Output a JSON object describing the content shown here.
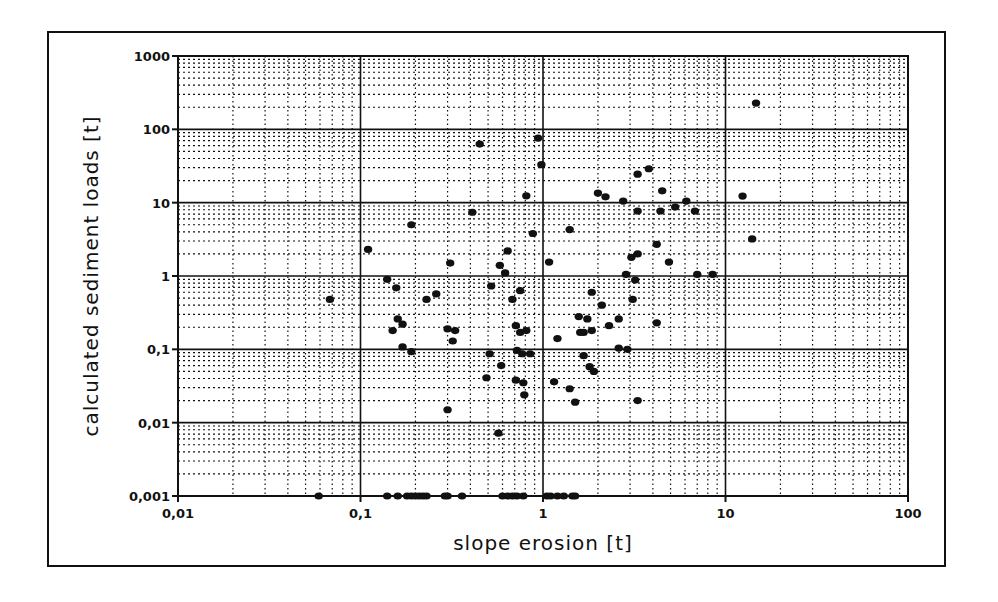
{
  "chart_data": {
    "type": "scatter",
    "title": "",
    "xlabel": "slope erosion [t]",
    "ylabel": "calculated sediment loads [t]",
    "xscale": "log",
    "yscale": "log",
    "xlim": [
      0.01,
      100
    ],
    "ylim": [
      0.001,
      1000
    ],
    "grid": "major solid, minor dotted (log 2-9)",
    "legend": null,
    "xticks": [
      0.01,
      0.1,
      1,
      10,
      100
    ],
    "xtick_labels": [
      "0,01",
      "0,1",
      "1",
      "10",
      "100"
    ],
    "yticks": [
      0.001,
      0.01,
      0.1,
      1,
      10,
      100,
      1000
    ],
    "ytick_labels": [
      "0,001",
      "0,01",
      "0,1",
      "1",
      "10",
      "100",
      "1000"
    ],
    "series": [
      {
        "name": "observations",
        "marker": "filled-circle",
        "color": "#111111",
        "points": [
          [
            0.45,
            63
          ],
          [
            0.94,
            76
          ],
          [
            0.98,
            33
          ],
          [
            0.81,
            12.4
          ],
          [
            0.41,
            7.4
          ],
          [
            0.19,
            5.0
          ],
          [
            0.88,
            3.8
          ],
          [
            0.11,
            2.3
          ],
          [
            0.64,
            2.2
          ],
          [
            0.31,
            1.5
          ],
          [
            0.58,
            1.4
          ],
          [
            1.08,
            1.55
          ],
          [
            0.62,
            1.1
          ],
          [
            0.14,
            0.9
          ],
          [
            0.068,
            0.48
          ],
          [
            0.157,
            0.69
          ],
          [
            0.23,
            0.48
          ],
          [
            0.26,
            0.57
          ],
          [
            0.16,
            0.26
          ],
          [
            0.17,
            0.22
          ],
          [
            0.15,
            0.18
          ],
          [
            0.3,
            0.19
          ],
          [
            0.33,
            0.18
          ],
          [
            0.32,
            0.13
          ],
          [
            0.17,
            0.108
          ],
          [
            0.19,
            0.093
          ],
          [
            0.52,
            0.73
          ],
          [
            0.75,
            0.63
          ],
          [
            0.68,
            0.48
          ],
          [
            0.71,
            0.21
          ],
          [
            0.75,
            0.17
          ],
          [
            0.81,
            0.18
          ],
          [
            1.2,
            0.14
          ],
          [
            0.51,
            0.087
          ],
          [
            0.72,
            0.097
          ],
          [
            0.77,
            0.087
          ],
          [
            0.85,
            0.087
          ],
          [
            0.59,
            0.06
          ],
          [
            0.49,
            0.041
          ],
          [
            0.71,
            0.038
          ],
          [
            0.78,
            0.035
          ],
          [
            1.15,
            0.036
          ],
          [
            0.79,
            0.024
          ],
          [
            0.3,
            0.015
          ],
          [
            0.57,
            0.0072
          ],
          [
            1.4,
            0.029
          ],
          [
            1.5,
            0.019
          ],
          [
            3.3,
            24.5
          ],
          [
            3.8,
            29
          ],
          [
            4.5,
            14.5
          ],
          [
            2.0,
            13.5
          ],
          [
            2.2,
            12
          ],
          [
            2.75,
            10.5
          ],
          [
            3.3,
            7.7
          ],
          [
            4.4,
            7.7
          ],
          [
            5.3,
            8.7
          ],
          [
            6.1,
            10.5
          ],
          [
            6.8,
            7.7
          ],
          [
            12.4,
            12.3
          ],
          [
            1.4,
            4.3
          ],
          [
            4.2,
            2.7
          ],
          [
            14,
            3.2
          ],
          [
            3.05,
            1.8
          ],
          [
            3.3,
            2.0
          ],
          [
            4.9,
            1.55
          ],
          [
            2.85,
            1.05
          ],
          [
            3.2,
            0.88
          ],
          [
            7.0,
            1.05
          ],
          [
            8.5,
            1.05
          ],
          [
            1.85,
            0.6
          ],
          [
            3.1,
            0.48
          ],
          [
            2.1,
            0.4
          ],
          [
            1.57,
            0.28
          ],
          [
            1.75,
            0.26
          ],
          [
            2.6,
            0.26
          ],
          [
            2.3,
            0.21
          ],
          [
            4.2,
            0.23
          ],
          [
            1.6,
            0.17
          ],
          [
            1.67,
            0.17
          ],
          [
            1.85,
            0.18
          ],
          [
            2.6,
            0.104
          ],
          [
            2.9,
            0.1
          ],
          [
            1.67,
            0.082
          ],
          [
            1.8,
            0.058
          ],
          [
            1.9,
            0.05
          ],
          [
            3.3,
            0.02
          ],
          [
            14.7,
            228
          ],
          [
            0.059,
            0.001
          ],
          [
            0.14,
            0.001
          ],
          [
            0.16,
            0.001
          ],
          [
            0.18,
            0.001
          ],
          [
            0.19,
            0.001
          ],
          [
            0.2,
            0.001
          ],
          [
            0.21,
            0.001
          ],
          [
            0.22,
            0.001
          ],
          [
            0.23,
            0.001
          ],
          [
            0.29,
            0.001
          ],
          [
            0.3,
            0.001
          ],
          [
            0.36,
            0.001
          ],
          [
            0.6,
            0.001
          ],
          [
            0.64,
            0.001
          ],
          [
            0.68,
            0.001
          ],
          [
            0.72,
            0.001
          ],
          [
            0.78,
            0.001
          ],
          [
            1.05,
            0.001
          ],
          [
            1.1,
            0.001
          ],
          [
            1.2,
            0.001
          ],
          [
            1.3,
            0.001
          ],
          [
            1.45,
            0.001
          ],
          [
            1.5,
            0.001
          ]
        ]
      }
    ]
  },
  "style": {
    "ink_color": "#111111",
    "background_color": "#ffffff"
  }
}
